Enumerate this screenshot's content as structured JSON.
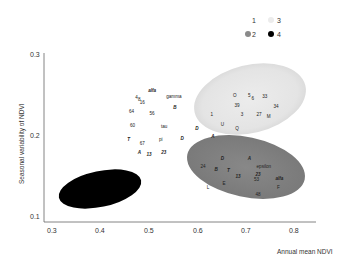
{
  "chart_data": {
    "type": "scatter",
    "title": "",
    "xlabel": "Annual mean NDVI",
    "ylabel": "Seasonal variability of NDVI",
    "xlim": [
      0.28,
      0.85
    ],
    "ylim": [
      0.09,
      0.3
    ],
    "xticks": [
      "0.3",
      "0.4",
      "0.5",
      "0.6",
      "0.7",
      "0.8"
    ],
    "yticks": [
      "0.1",
      "0.2",
      "0.3"
    ],
    "grid": false,
    "legend": {
      "position": "top-right",
      "entries": [
        {
          "label": "1",
          "color": "#ffffff"
        },
        {
          "label": "3",
          "color": "#e8e8e8"
        },
        {
          "label": "2",
          "color": "#8a8a8a"
        },
        {
          "label": "4",
          "color": "#000000"
        }
      ]
    },
    "groups": [
      {
        "name": "1",
        "color": "#ffffff",
        "region": null,
        "points": [
          {
            "label": "alfa",
            "x": 0.51,
            "y": 0.255,
            "italic": true
          },
          {
            "label": "4",
            "x": 0.478,
            "y": 0.246
          },
          {
            "label": "8",
            "x": 0.484,
            "y": 0.243
          },
          {
            "label": "16",
            "x": 0.49,
            "y": 0.24
          },
          {
            "label": "gamma",
            "x": 0.555,
            "y": 0.247
          },
          {
            "label": "B",
            "x": 0.557,
            "y": 0.233,
            "italic": true
          },
          {
            "label": "64",
            "x": 0.468,
            "y": 0.228
          },
          {
            "label": "56",
            "x": 0.51,
            "y": 0.226
          },
          {
            "label": "60",
            "x": 0.47,
            "y": 0.211
          },
          {
            "label": "tau",
            "x": 0.535,
            "y": 0.21
          },
          {
            "label": "T",
            "x": 0.462,
            "y": 0.194,
            "italic": true
          },
          {
            "label": "67",
            "x": 0.49,
            "y": 0.189
          },
          {
            "label": "pi",
            "x": 0.528,
            "y": 0.194
          },
          {
            "label": "D",
            "x": 0.572,
            "y": 0.195,
            "italic": true
          },
          {
            "label": "A",
            "x": 0.484,
            "y": 0.178,
            "italic": true
          },
          {
            "label": "13",
            "x": 0.504,
            "y": 0.175,
            "italic": true
          },
          {
            "label": "23",
            "x": 0.534,
            "y": 0.178,
            "italic": true
          }
        ]
      },
      {
        "name": "3",
        "color": "#e8e8e8",
        "region": {
          "cx": 0.705,
          "cy": 0.228,
          "rx": 0.115,
          "ry": 0.037,
          "rotate": -14
        },
        "points": [
          {
            "label": "O",
            "x": 0.68,
            "y": 0.248
          },
          {
            "label": "5",
            "x": 0.71,
            "y": 0.248
          },
          {
            "label": "6",
            "x": 0.717,
            "y": 0.245
          },
          {
            "label": "33",
            "x": 0.742,
            "y": 0.247
          },
          {
            "label": "39",
            "x": 0.685,
            "y": 0.236
          },
          {
            "label": "34",
            "x": 0.765,
            "y": 0.235
          },
          {
            "label": "1",
            "x": 0.633,
            "y": 0.225
          },
          {
            "label": "3",
            "x": 0.695,
            "y": 0.225
          },
          {
            "label": "27",
            "x": 0.73,
            "y": 0.225
          },
          {
            "label": "M",
            "x": 0.75,
            "y": 0.222
          },
          {
            "label": "U",
            "x": 0.655,
            "y": 0.212
          },
          {
            "label": "Q",
            "x": 0.685,
            "y": 0.207
          },
          {
            "label": "D",
            "x": 0.602,
            "y": 0.207,
            "italic": true
          },
          {
            "label": "A",
            "x": 0.635,
            "y": 0.198,
            "italic": true
          }
        ]
      },
      {
        "name": "2",
        "color": "#8a8a8a",
        "region": {
          "cx": 0.7,
          "cy": 0.145,
          "rx": 0.115,
          "ry": 0.033,
          "rotate": 10
        },
        "points": [
          {
            "label": "D",
            "x": 0.655,
            "y": 0.17,
            "italic": true
          },
          {
            "label": "A",
            "x": 0.71,
            "y": 0.171,
            "italic": true
          },
          {
            "label": "24",
            "x": 0.615,
            "y": 0.16
          },
          {
            "label": "epsilon",
            "x": 0.74,
            "y": 0.161
          },
          {
            "label": "B",
            "x": 0.642,
            "y": 0.157,
            "italic": true
          },
          {
            "label": "T",
            "x": 0.667,
            "y": 0.156,
            "italic": true
          },
          {
            "label": "13",
            "x": 0.687,
            "y": 0.148,
            "italic": true
          },
          {
            "label": "23",
            "x": 0.728,
            "y": 0.151,
            "italic": true
          },
          {
            "label": "alfa",
            "x": 0.772,
            "y": 0.146,
            "italic": true
          },
          {
            "label": "53",
            "x": 0.725,
            "y": 0.144
          },
          {
            "label": "E",
            "x": 0.658,
            "y": 0.14
          },
          {
            "label": "L",
            "x": 0.625,
            "y": 0.135
          },
          {
            "label": "F",
            "x": 0.77,
            "y": 0.135
          },
          {
            "label": "48",
            "x": 0.728,
            "y": 0.126
          }
        ]
      },
      {
        "name": "4",
        "color": "#000000",
        "region": {
          "cx": 0.39,
          "cy": 0.128,
          "rx": 0.085,
          "ry": 0.021,
          "rotate": -12
        },
        "points": []
      }
    ]
  }
}
